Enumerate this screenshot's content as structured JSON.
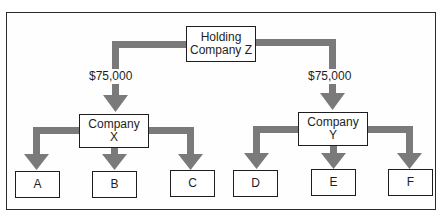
{
  "diagram": {
    "type": "organizational-ownership-chart",
    "colors": {
      "connector": "#7a7a7a",
      "border": "#1e1e1e",
      "background": "#ffffff"
    },
    "root": {
      "line1": "Holding",
      "line2": "Company Z"
    },
    "subsidiaries": [
      {
        "line1": "Company",
        "line2": "X",
        "transfer_label": "$75,000",
        "children": [
          "A",
          "B",
          "C"
        ]
      },
      {
        "line1": "Company",
        "line2": "Y",
        "transfer_label": "$75,000",
        "children": [
          "D",
          "E",
          "F"
        ]
      }
    ]
  }
}
